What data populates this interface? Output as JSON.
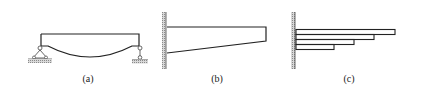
{
  "figure": {
    "panels": [
      {
        "id": "a",
        "label": "(a)",
        "description": "Simply supported beam with curved (fish-bellied) bottom edge, pin support left, roller support right"
      },
      {
        "id": "b",
        "label": "(b)",
        "description": "Tapered cantilever beam fixed to a wall, depth decreasing toward free end"
      },
      {
        "id": "c",
        "label": "(c)",
        "description": "Stepped cantilever made of four stacked plates of decreasing length fixed to a wall"
      }
    ],
    "colors": {
      "line": "#222222",
      "hatch": "#9a9a9a",
      "background": "#ffffff"
    }
  }
}
